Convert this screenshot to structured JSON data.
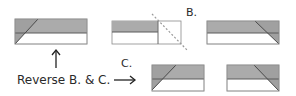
{
  "labels": {
    "b": "B.",
    "c": "C.",
    "instruction": "Reverse B. & C."
  },
  "colors": {
    "fill": "#ababab",
    "stroke": "#5a5a5a",
    "edge": "#c8c8c8",
    "text": "#2a2a2a"
  },
  "steps": [
    {
      "id": "strip-left-diagonal",
      "description": "Strip with gray top half and left diagonal triangle"
    },
    {
      "id": "strip-square-fold",
      "description": "Strip with square at right, dotted fold line B"
    },
    {
      "id": "strip-right-diagonal",
      "description": "Strip with gray top half and right diagonal triangle"
    },
    {
      "id": "short-left-diagonal",
      "description": "Short strip with left diagonal triangle (C)"
    },
    {
      "id": "short-right-diagonal",
      "description": "Short strip with right diagonal triangle"
    }
  ]
}
